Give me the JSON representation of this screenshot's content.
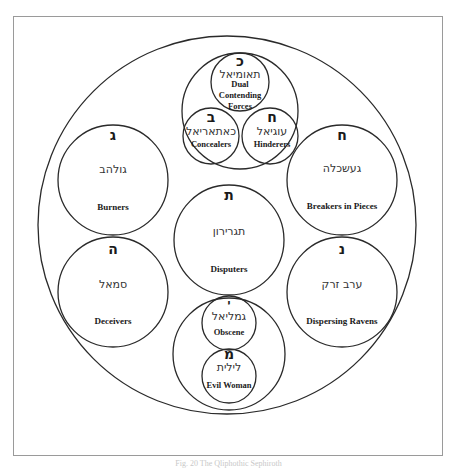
{
  "diagram": {
    "type": "nested-circles",
    "outer_circle": {
      "label": ""
    },
    "top_group": {
      "nodes": [
        {
          "id": "dual",
          "letter": "כ",
          "hebrew": "תאומיאל",
          "english_lines": [
            "Dual",
            "Contending",
            "Forces"
          ]
        },
        {
          "id": "concealers",
          "letter": "ב",
          "hebrew": "כאתאריאל",
          "english": "Concealers"
        },
        {
          "id": "hinderers",
          "letter": "ח",
          "hebrew": "עוגיאל",
          "english": "Hinderers"
        }
      ]
    },
    "middle_nodes": [
      {
        "id": "burners",
        "letter": "ג",
        "hebrew": "גולהב",
        "english": "Burners"
      },
      {
        "id": "breakers",
        "letter": "ח",
        "hebrew": "געשכלה",
        "english": "Breakers in Pieces"
      },
      {
        "id": "disputers",
        "letter": "ת",
        "hebrew": "תגרירון",
        "english": "Disputers"
      },
      {
        "id": "deceivers",
        "letter": "ה",
        "hebrew": "סמאל",
        "english": "Deceivers"
      },
      {
        "id": "ravens",
        "letter": "נ",
        "hebrew": "ערב זרק",
        "english": "Dispersing Ravens"
      }
    ],
    "bottom_group": {
      "nodes": [
        {
          "id": "obscene",
          "letter": "י",
          "hebrew": "גמליאל",
          "english": "Obscene"
        },
        {
          "id": "evil_woman",
          "letter": "מ",
          "hebrew": "לילית",
          "english": "Evil Woman"
        }
      ]
    }
  },
  "caption": "Fig. 20 The Qliphothic Sephiroth"
}
